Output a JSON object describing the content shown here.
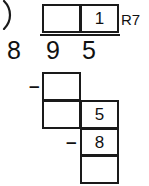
{
  "problem": {
    "type": "long-division",
    "divisor": "8",
    "dividend_digits": [
      "9",
      "5"
    ],
    "dividend": "95",
    "bracket_glyph": ")",
    "remainder_label": "R7"
  },
  "quotient_row": {
    "boxes": [
      {
        "name": "quotient-tens",
        "value": ""
      },
      {
        "name": "quotient-ones",
        "value": "1"
      }
    ]
  },
  "working": {
    "minus_signs": [
      {
        "name": "minus-first",
        "value": "–"
      },
      {
        "name": "minus-second",
        "value": "–"
      }
    ],
    "left_column": [
      {
        "name": "subtrahend-tens",
        "value": ""
      },
      {
        "name": "difference-tens",
        "value": ""
      }
    ],
    "right_column": [
      {
        "name": "brought-down-digit",
        "value": "5"
      },
      {
        "name": "second-subtrahend",
        "value": "8"
      },
      {
        "name": "final-remainder",
        "value": ""
      }
    ]
  },
  "colors": {
    "ink": "#111111",
    "rule": "#1a1a1a",
    "paper": "#ffffff"
  }
}
